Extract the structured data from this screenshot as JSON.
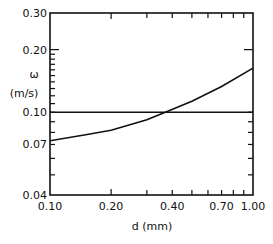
{
  "chart_data": {
    "type": "line",
    "title": "",
    "xlabel": "d (mm)",
    "ylabel_symbol": "ω",
    "ylabel_unit": "(m/s)",
    "xscale": "log",
    "yscale": "log",
    "xlim": [
      0.1,
      1.0
    ],
    "ylim": [
      0.04,
      0.3
    ],
    "x_tick_labels": [
      "0.10",
      "0.20",
      "0.40",
      "0.70",
      "1.00"
    ],
    "x_ticks": [
      0.1,
      0.2,
      0.4,
      0.7,
      1.0
    ],
    "y_tick_labels": [
      "0.30",
      "0.20",
      "0.10",
      "0.07",
      "0.04"
    ],
    "y_ticks": [
      0.3,
      0.2,
      0.1,
      0.07,
      0.04
    ],
    "grid": false,
    "series": [
      {
        "name": "curve",
        "x": [
          0.1,
          0.15,
          0.2,
          0.3,
          0.37,
          0.5,
          0.7,
          1.0
        ],
        "y": [
          0.073,
          0.078,
          0.082,
          0.092,
          0.1,
          0.113,
          0.133,
          0.163
        ]
      },
      {
        "name": "horizontal reference",
        "x": [
          0.1,
          1.0
        ],
        "y": [
          0.1,
          0.1
        ]
      }
    ],
    "annotations": [
      "curve crosses 0.10 m/s at d ≈ 0.37 mm"
    ]
  }
}
